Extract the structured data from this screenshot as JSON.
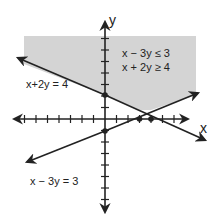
{
  "diagram": {
    "type": "system-of-linear-inequalities-graph",
    "axes": {
      "x_label": "x",
      "y_label": "y",
      "origin_px": [
        105,
        119
      ],
      "unit_px": 11.5,
      "x_tick_range": [
        -8,
        8
      ],
      "y_tick_range": [
        -8,
        7
      ]
    },
    "inequalities": [
      "x − 3y ≤ 3",
      "x + 2y ≥ 4"
    ],
    "lines": [
      {
        "label": "x+2y = 4",
        "equation": "x + 2y = 4",
        "y_intercept": 2,
        "x_intercept": 4
      },
      {
        "label": "x − 3y = 3",
        "equation": "x − 3y = 3",
        "y_intercept": -1,
        "x_intercept": 3
      }
    ],
    "points": [
      {
        "x": 0,
        "y": 2
      },
      {
        "x": 0,
        "y": -1
      },
      {
        "x": 3,
        "y": 0
      },
      {
        "x": 4,
        "y": 0
      }
    ],
    "colors": {
      "shade": "#d4d4d4",
      "line": "#222222"
    }
  }
}
